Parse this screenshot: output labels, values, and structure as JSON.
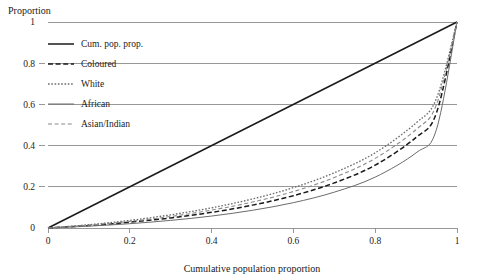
{
  "chart_data": {
    "type": "line",
    "title": "",
    "xlabel": "Cumulative population proportion",
    "ylabel": "Proportion",
    "xlim": [
      0,
      1
    ],
    "ylim": [
      0,
      1
    ],
    "grid": true,
    "legend_position": "upper-left",
    "xticks": [
      "0",
      "0.2",
      "0.4",
      "0.6",
      "0.8",
      "1"
    ],
    "xtick_values": [
      0,
      0.2,
      0.4,
      0.6,
      0.8,
      1
    ],
    "yticks": [
      "0",
      "0.2",
      "0.4",
      "0.6",
      "0.8",
      "1"
    ],
    "ytick_values": [
      0,
      0.2,
      0.4,
      0.6,
      0.8,
      1
    ],
    "x": [
      0,
      0.1,
      0.2,
      0.3,
      0.4,
      0.5,
      0.6,
      0.7,
      0.8,
      0.9,
      0.95,
      1
    ],
    "series": [
      {
        "name": "Cum. pop. prop.",
        "style": "solid",
        "width": 1.5,
        "color": "#1a1a1a",
        "values": [
          0,
          0.1,
          0.2,
          0.3,
          0.4,
          0.5,
          0.6,
          0.7,
          0.8,
          0.9,
          0.95,
          1
        ]
      },
      {
        "name": "Coloured",
        "style": "dashed",
        "width": 1.5,
        "color": "#1a1a1a",
        "values": [
          0,
          0.012,
          0.028,
          0.049,
          0.076,
          0.111,
          0.157,
          0.219,
          0.305,
          0.44,
          0.56,
          1
        ]
      },
      {
        "name": "White",
        "style": "dotted",
        "width": 1.3,
        "color": "#6b6b6b",
        "values": [
          0,
          0.016,
          0.037,
          0.064,
          0.098,
          0.141,
          0.196,
          0.268,
          0.365,
          0.51,
          0.63,
          1
        ]
      },
      {
        "name": "African",
        "style": "solid",
        "width": 1.0,
        "color": "#6b6b6b",
        "values": [
          0,
          0.009,
          0.021,
          0.037,
          0.058,
          0.086,
          0.123,
          0.174,
          0.247,
          0.365,
          0.48,
          1
        ]
      },
      {
        "name": "Asian/Indian",
        "style": "dashed-light",
        "width": 1.1,
        "color": "#8a8a8a",
        "values": [
          0,
          0.014,
          0.032,
          0.056,
          0.087,
          0.126,
          0.177,
          0.245,
          0.338,
          0.478,
          0.6,
          1
        ]
      }
    ],
    "legend_entries": [
      {
        "label": "Cum. pop. prop.",
        "style": "solid",
        "color": "#1a1a1a"
      },
      {
        "label": "Coloured",
        "style": "dashed",
        "color": "#1a1a1a"
      },
      {
        "label": "White",
        "style": "dotted",
        "color": "#6b6b6b"
      },
      {
        "label": "African",
        "style": "solid-thin",
        "color": "#6b6b6b"
      },
      {
        "label": "Asian/Indian",
        "style": "dashed-light",
        "color": "#8a8a8a"
      }
    ]
  }
}
